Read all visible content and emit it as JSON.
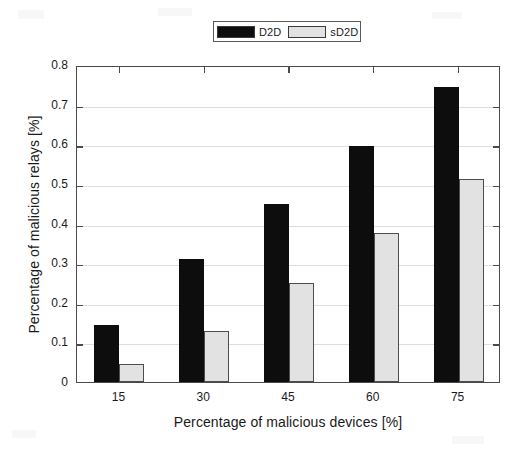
{
  "chart_data": {
    "type": "bar",
    "title": "",
    "subtitle": "",
    "xlabel": "Percentage of malicious devices [%]",
    "ylabel": "Percentage of malicious relays [%]",
    "categories": [
      "15",
      "30",
      "45",
      "60",
      "75"
    ],
    "series": [
      {
        "name": "D2D",
        "color": "#0d0d0d",
        "values": [
          0.145,
          0.31,
          0.45,
          0.595,
          0.745
        ]
      },
      {
        "name": "sD2D",
        "color": "#e2e2e2",
        "values": [
          0.045,
          0.13,
          0.25,
          0.377,
          0.513
        ]
      }
    ],
    "ylim": [
      0,
      0.8
    ],
    "yticks": [
      "0",
      "0.1",
      "0.2",
      "0.3",
      "0.4",
      "0.5",
      "0.6",
      "0.7",
      "0.8"
    ],
    "ytick_values": [
      0,
      0.1,
      0.2,
      0.3,
      0.4,
      0.5,
      0.6,
      0.7,
      0.8
    ],
    "xtick_labels": [
      "15",
      "30",
      "45",
      "60",
      "75"
    ],
    "grid": true,
    "grid_axis": "y",
    "legend_position": "top-center",
    "legend_entries": [
      "D2D",
      "sD2D"
    ],
    "bar_mode": "grouped"
  },
  "legend": {
    "entries": [
      {
        "label": "D2D",
        "swatch_color": "#0d0d0d"
      },
      {
        "label": "sD2D",
        "swatch_color": "#e2e2e2"
      }
    ]
  },
  "axes": {
    "y_title": "Percentage of malicious relays [%]",
    "x_title": "Percentage of malicious devices [%]",
    "y_ticks": [
      "0.8",
      "0.7",
      "0.6",
      "0.5",
      "0.4",
      "0.3",
      "0.2",
      "0.1",
      "0"
    ],
    "x_ticks": [
      "15",
      "30",
      "45",
      "60",
      "75"
    ]
  }
}
